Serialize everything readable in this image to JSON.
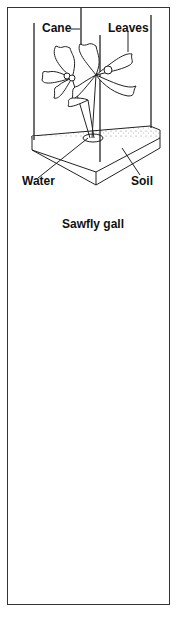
{
  "figure": {
    "panels": [
      {
        "id": "potted-seedling",
        "labels": {
          "cane": "Cane",
          "leaves": "Leaves",
          "water": "Water",
          "soil": "Soil"
        }
      },
      {
        "id": "sawfly-gall-detail",
        "labels": {
          "title": "Sawfly gall"
        }
      },
      {
        "id": "covered-seedling",
        "labels": {}
      }
    ],
    "colors": {
      "ink": "#222222",
      "background": "#ffffff",
      "leaf_shade": "#b8b8b8",
      "gall_dark": "#3a3a3a",
      "soil_speckle": "#888888"
    }
  }
}
